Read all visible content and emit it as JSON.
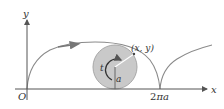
{
  "diagram": {
    "type": "cycloid",
    "labels": {
      "y_axis": "y",
      "x_axis": "x",
      "origin": "O",
      "point": "(x, y)",
      "angle": "t",
      "radius": "a",
      "period_mark_num": "2",
      "period_mark_pi": "π",
      "period_mark_a": "a"
    },
    "colors": {
      "curve": "#8a8a8a",
      "circle_fill": "#c8c8c8",
      "circle_stroke": "#a0a0a0",
      "axis": "#555555",
      "text": "#333333",
      "line": "#666666"
    }
  }
}
